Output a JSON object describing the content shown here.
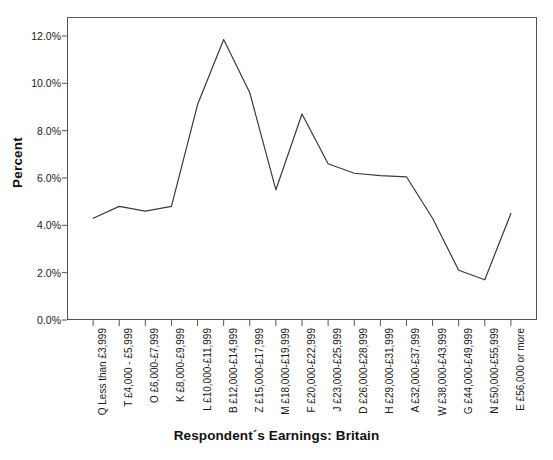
{
  "chart_data": {
    "type": "line",
    "title": "",
    "xlabel": "Respondent´s Earnings: Britain",
    "ylabel": "Percent",
    "ylim": [
      0,
      12.8
    ],
    "yticks": [
      0,
      2,
      4,
      6,
      8,
      10,
      12
    ],
    "ytick_labels": [
      "0.0%",
      "2.0%",
      "4.0%",
      "6.0%",
      "8.0%",
      "10.0%",
      "12.0%"
    ],
    "grid": false,
    "legend": null,
    "categories": [
      "Q Less than £3,999",
      "T £4,000 - £5,999",
      "O £6,000-£7,999",
      "K £8,000-£9,999",
      "L £10,000-£11,999",
      "B £12,000-£14,999",
      "Z £15,000-£17,999",
      "M £18,000-£19,999",
      "F £20,000-£22,999",
      "J £23,000-£25,999",
      "D £26,000-£28,999",
      "H £29,000-£31,999",
      "A £32,000-£37,999",
      "W £38,000-£43,999",
      "G £44,000-£49,999",
      "N £50,000-£55,999",
      "E £56,000 or more"
    ],
    "values": [
      4.3,
      4.8,
      4.6,
      4.8,
      9.1,
      11.85,
      9.6,
      5.5,
      8.7,
      6.6,
      6.2,
      6.1,
      6.05,
      4.3,
      2.1,
      1.7,
      4.5
    ]
  },
  "axis": {
    "ylabel": "Percent",
    "xlabel": "Respondent´s Earnings: Britain"
  }
}
